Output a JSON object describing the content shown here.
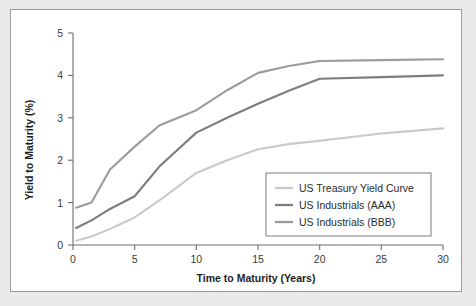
{
  "chart_data": {
    "type": "line",
    "title": "",
    "xlabel": "Time to Maturity (Years)",
    "ylabel": "Yield to Maturity (%)",
    "xlim": [
      0,
      30
    ],
    "ylim": [
      0,
      5
    ],
    "xticks": [
      0,
      5,
      10,
      15,
      20,
      25,
      30
    ],
    "yticks": [
      0,
      1,
      2,
      3,
      4,
      5
    ],
    "xtick_labels": [
      "0",
      "5",
      "10",
      "15",
      "20",
      "25",
      "30"
    ],
    "ytick_labels": [
      "0",
      "1",
      "2",
      "3",
      "4",
      "5"
    ],
    "grid": false,
    "legend_position": "lower right",
    "x": [
      0.25,
      1.5,
      3,
      5,
      7,
      10,
      12.5,
      15,
      17.5,
      20,
      25,
      30
    ],
    "series": [
      {
        "name": "US Treasury Yield Curve",
        "color": "#c9c9c9",
        "values": [
          0.1,
          0.2,
          0.38,
          0.65,
          1.05,
          1.7,
          2.0,
          2.26,
          2.38,
          2.46,
          2.63,
          2.75
        ]
      },
      {
        "name": "US Industrials (AAA)",
        "color": "#7d7d7d",
        "values": [
          0.4,
          0.58,
          0.85,
          1.15,
          1.85,
          2.65,
          3.0,
          3.33,
          3.64,
          3.92,
          3.96,
          4.0
        ]
      },
      {
        "name": "US Industrials (BBB)",
        "color": "#9b9b9b",
        "values": [
          0.88,
          1.0,
          1.78,
          2.32,
          2.82,
          3.18,
          3.65,
          4.06,
          4.22,
          4.34,
          4.36,
          4.38
        ]
      }
    ]
  },
  "legend": {
    "entries": [
      {
        "label": "US Treasury Yield Curve",
        "color": "#c9c9c9"
      },
      {
        "label": "US Industrials (AAA)",
        "color": "#7d7d7d"
      },
      {
        "label": "US Industrials (BBB)",
        "color": "#9b9b9b"
      }
    ]
  },
  "colors": {
    "page_background": "#e9e9e9",
    "card_background": "#ffffff",
    "card_border": "#9a9a9a",
    "axis": "#6d6d6d",
    "text": "#1d1d1d"
  }
}
